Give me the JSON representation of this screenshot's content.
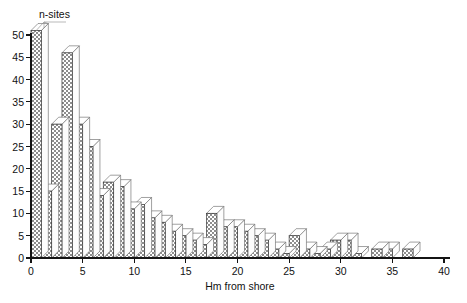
{
  "chart_data": {
    "type": "bar",
    "title": "",
    "ylabel": "n-sites",
    "xlabel": "Hm from shore",
    "xlim": [
      0,
      40
    ],
    "ylim": [
      0,
      50
    ],
    "xticks": [
      0,
      5,
      10,
      15,
      20,
      25,
      30,
      35,
      40
    ],
    "yticks": [
      0,
      5,
      10,
      15,
      20,
      25,
      30,
      35,
      40,
      45,
      50
    ],
    "grid": false,
    "legend": "none",
    "bin_width": 1,
    "style": "3d-histogram-hatched",
    "categories": [
      "0-1",
      "1-2",
      "2-3",
      "3-4",
      "4-5",
      "5-6",
      "6-7",
      "7-8",
      "8-9",
      "9-10",
      "10-11",
      "11-12",
      "12-13",
      "13-14",
      "14-15",
      "15-16",
      "16-17",
      "17-18",
      "18-19",
      "19-20",
      "20-21",
      "21-22",
      "22-23",
      "23-24",
      "24-25",
      "25-26",
      "26-27",
      "27-28",
      "28-29",
      "29-30",
      "30-31",
      "31-32",
      "32-33",
      "33-34",
      "34-35",
      "35-36",
      "36-37",
      "37-38",
      "38-39",
      "39-40"
    ],
    "x": [
      0,
      1,
      2,
      3,
      4,
      5,
      6,
      7,
      8,
      9,
      10,
      11,
      12,
      13,
      14,
      15,
      16,
      17,
      18,
      19,
      20,
      21,
      22,
      23,
      24,
      25,
      26,
      27,
      28,
      29,
      30,
      31,
      32,
      33,
      34,
      35,
      36,
      37,
      38,
      39
    ],
    "values": [
      51,
      15,
      30,
      46,
      30,
      25,
      14,
      17,
      16,
      11,
      12,
      9,
      8,
      6,
      5,
      4,
      3,
      10,
      7,
      7,
      6,
      5,
      4,
      2,
      1,
      5,
      2,
      1,
      2,
      4,
      4,
      1,
      0,
      2,
      2,
      0,
      2,
      0,
      0,
      0
    ],
    "colors": {
      "bar_fill": "#ffffff",
      "bar_hatch": "#555555",
      "bar_outline": "#3a3a3a",
      "axis": "#141414",
      "text": "#111111",
      "background": "#ffffff"
    }
  }
}
